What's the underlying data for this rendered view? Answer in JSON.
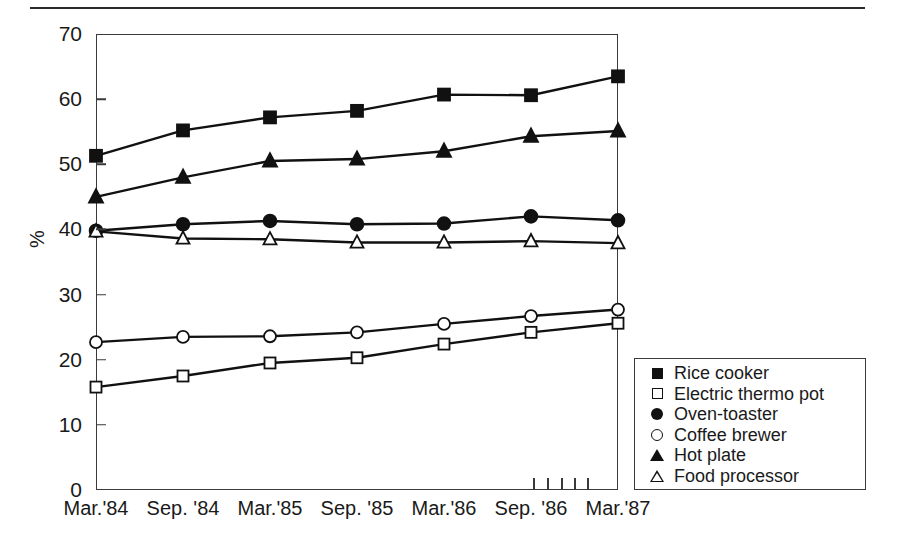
{
  "figure": {
    "background_color": "#ffffff",
    "line_color": "#111111",
    "axis_color": "#3a3a3a"
  },
  "axis_title_y": "%",
  "y_ticklabels": [
    "70",
    "60",
    "50",
    "40",
    "30",
    "20",
    "10",
    "0"
  ],
  "x_ticklabels": [
    "Mar.'84",
    "Sep. '84",
    "Mar.'85",
    "Sep. '85",
    "Mar.'86",
    "Sep. '86",
    "Mar.'87"
  ],
  "legend": {
    "items": [
      {
        "label": "Rice cooker",
        "marker": "filled-square"
      },
      {
        "label": "Electric thermo pot",
        "marker": "open-square"
      },
      {
        "label": "Oven-toaster",
        "marker": "filled-circle"
      },
      {
        "label": "Coffee brewer",
        "marker": "open-circle"
      },
      {
        "label": "Hot plate",
        "marker": "filled-triangle"
      },
      {
        "label": "Food processor",
        "marker": "open-triangle"
      }
    ]
  },
  "chart_data": {
    "type": "line",
    "title": "",
    "xlabel": "",
    "ylabel": "%",
    "ylim": [
      0,
      70
    ],
    "ytick_step": 10,
    "grid": false,
    "legend_position": "right-bottom-inside",
    "categories": [
      "Mar.'84",
      "Sep. '84",
      "Mar.'85",
      "Sep. '85",
      "Mar.'86",
      "Sep. '86",
      "Mar.'87"
    ],
    "series": [
      {
        "name": "Rice cooker",
        "marker": "filled-square",
        "values": [
          51.3,
          55.2,
          57.2,
          58.2,
          60.7,
          60.6,
          63.5
        ]
      },
      {
        "name": "Electric thermo pot",
        "marker": "open-square",
        "values": [
          15.8,
          17.5,
          19.5,
          20.3,
          22.4,
          24.2,
          25.6
        ]
      },
      {
        "name": "Oven-toaster",
        "marker": "filled-circle",
        "values": [
          39.8,
          40.8,
          41.3,
          40.8,
          40.9,
          42.0,
          41.4
        ]
      },
      {
        "name": "Coffee brewer",
        "marker": "open-circle",
        "values": [
          22.7,
          23.5,
          23.6,
          24.2,
          25.5,
          26.7,
          27.7
        ]
      },
      {
        "name": "Hot plate",
        "marker": "filled-triangle",
        "values": [
          45.0,
          48.0,
          50.5,
          50.8,
          52.0,
          54.3,
          55.1
        ]
      },
      {
        "name": "Food processor",
        "marker": "open-triangle",
        "values": [
          39.7,
          38.6,
          38.5,
          38.0,
          38.0,
          38.2,
          37.9
        ]
      }
    ]
  }
}
